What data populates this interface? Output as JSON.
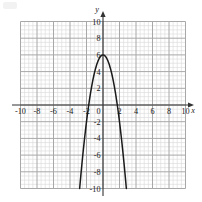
{
  "figure": {
    "kind": "cartesian-graph",
    "axis_labels": {
      "x": "x",
      "y": "y"
    },
    "colors": {
      "curve": "#1a1a1a",
      "axis": "#333333",
      "major_grid": "#a8a8a8",
      "minor_grid": "#d8d8d8",
      "label": "#1a1a1a",
      "background": "#ffffff"
    }
  },
  "chart_data": {
    "type": "line",
    "title": "",
    "subtitle": "",
    "xlabel": "x",
    "ylabel": "y",
    "xlim": [
      -10.6,
      10.6
    ],
    "ylim": [
      -10.6,
      10.6
    ],
    "grid": true,
    "grid_major_step": 2,
    "grid_minor_step": 0.5,
    "legend": "none",
    "x_tick_labels": [
      "-10",
      "-8",
      "-6",
      "-4",
      "-2",
      "0",
      "2",
      "4",
      "6",
      "8",
      "10"
    ],
    "x_ticks": [
      -10,
      -8,
      -6,
      -4,
      -2,
      0,
      2,
      4,
      6,
      8,
      10
    ],
    "y_tick_labels": [
      "10",
      "8",
      "6",
      "4",
      "2",
      "-2",
      "-4",
      "-6",
      "-8",
      "-10"
    ],
    "y_ticks": [
      10,
      8,
      6,
      4,
      2,
      -2,
      -4,
      -6,
      -8,
      -10
    ],
    "annotations": [],
    "series": [
      {
        "name": "parabola",
        "equation": "y = -2x^2 + 6",
        "vertex": [
          0,
          6
        ],
        "x_intercepts": [
          -1.73,
          1.73
        ],
        "y_intercept": 6,
        "opens": "down",
        "leading_coefficient": -2,
        "x": [
          -2.83,
          -2.7,
          -2.55,
          -2.4,
          -2.25,
          -2.1,
          -1.95,
          -1.8,
          -1.65,
          -1.5,
          -1.35,
          -1.2,
          -1.05,
          -0.9,
          -0.75,
          -0.6,
          -0.45,
          -0.3,
          -0.15,
          0,
          0.15,
          0.3,
          0.45,
          0.6,
          0.75,
          0.9,
          1.05,
          1.2,
          1.35,
          1.5,
          1.65,
          1.8,
          1.95,
          2.1,
          2.25,
          2.4,
          2.55,
          2.7,
          2.83
        ],
        "y": [
          -10,
          -8.58,
          -7.01,
          -5.52,
          -4.13,
          -2.82,
          -1.61,
          -0.48,
          0.56,
          1.5,
          2.36,
          3.12,
          3.8,
          4.38,
          4.88,
          5.28,
          5.6,
          5.82,
          5.96,
          6,
          5.96,
          5.82,
          5.6,
          5.28,
          4.88,
          4.38,
          3.8,
          3.12,
          2.36,
          1.5,
          0.56,
          -0.48,
          -1.61,
          -2.82,
          -4.13,
          -5.52,
          -7.01,
          -8.58,
          -10
        ]
      }
    ]
  }
}
